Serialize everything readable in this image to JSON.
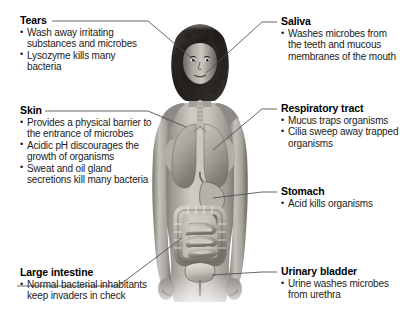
{
  "diagram": {
    "style": "grayscale anatomical illustration with labeled leader lines",
    "figure_description": "Front view of a woman with internal organs visible: lungs, trachea, stomach, small and large intestines, urinary bladder"
  },
  "callouts": [
    {
      "id": "tears",
      "heading": "Tears",
      "side": "left",
      "items": [
        "Wash away irritating substances and microbes",
        "Lysozyme kills many bacteria"
      ]
    },
    {
      "id": "skin",
      "heading": "Skin",
      "side": "left",
      "items": [
        "Provides a physical barrier to the entrance of microbes",
        "Acidic pH discourages the growth of organisms",
        "Sweat and oil gland secretions kill many bacteria"
      ]
    },
    {
      "id": "large-intestine",
      "heading": "Large intestine",
      "side": "left",
      "items": [
        "Normal bacterial inhabitants keep invaders in check"
      ]
    },
    {
      "id": "saliva",
      "heading": "Saliva",
      "side": "right",
      "items": [
        "Washes microbes from the teeth and mucous membranes of the mouth"
      ]
    },
    {
      "id": "respiratory-tract",
      "heading": "Respiratory tract",
      "side": "right",
      "items": [
        "Mucus traps organisms",
        "Cilia sweep away trapped organisms"
      ]
    },
    {
      "id": "stomach",
      "heading": "Stomach",
      "side": "right",
      "items": [
        "Acid kills organisms"
      ]
    },
    {
      "id": "urinary-bladder",
      "heading": "Urinary bladder",
      "side": "right",
      "items": [
        "Urine washes microbes from urethra"
      ]
    }
  ],
  "colors": {
    "background": "#ffffff",
    "text": "#000000",
    "body_text": "#1b1b1b",
    "leader_line": "#4a4a4a",
    "skin_light": "#d8d4cf",
    "skin_mid": "#a9a49e",
    "skin_dark": "#6e6a66",
    "hair": "#2a2724",
    "organ_light": "#cfcac4",
    "organ_mid": "#98928c",
    "organ_dark": "#5d5953"
  }
}
